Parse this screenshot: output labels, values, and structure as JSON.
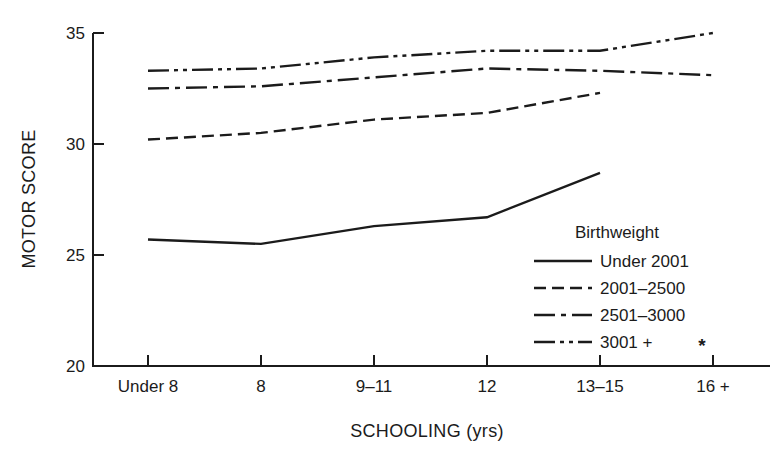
{
  "figure": {
    "background": "#ffffff",
    "ink_color": "#1b1b1b"
  },
  "chart_data": {
    "type": "line",
    "title": "",
    "xlabel": "SCHOOLING (yrs)",
    "ylabel": "MOTOR SCORE",
    "categories": [
      "Under 8",
      "8",
      "9–11",
      "12",
      "13–15",
      "16 +"
    ],
    "y_ticks": [
      20,
      25,
      30,
      35
    ],
    "ylim": [
      20,
      35
    ],
    "grid": false,
    "legend": {
      "title": "Birthweight",
      "position": "inside lower right",
      "entries": [
        "Under 2001",
        "2001–2500",
        "2501–3000",
        "3001 +"
      ]
    },
    "series": [
      {
        "name": "Under 2001",
        "line_style": "solid",
        "values": [
          25.7,
          25.5,
          26.3,
          26.7,
          28.7,
          null
        ]
      },
      {
        "name": "2001–2500",
        "line_style": "dashed",
        "values": [
          30.2,
          30.5,
          31.1,
          31.4,
          32.3,
          null
        ]
      },
      {
        "name": "2501–3000",
        "line_style": "dash-dot",
        "values": [
          32.5,
          32.6,
          33.0,
          33.4,
          33.3,
          33.1
        ]
      },
      {
        "name": "3001 +",
        "line_style": "dash-dot-dot",
        "values": [
          33.3,
          33.4,
          33.9,
          34.2,
          34.2,
          35.0
        ]
      }
    ],
    "annotations": [
      {
        "text": "*",
        "x_category": "16 +",
        "y_value": 20.9
      }
    ]
  }
}
